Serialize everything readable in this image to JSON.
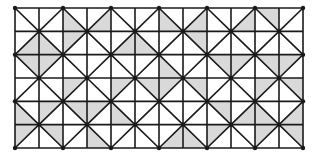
{
  "diagram": {
    "type": "tiling-grid",
    "grid": {
      "left": 15,
      "top": 8,
      "right": 303,
      "bottom": 148,
      "columns": 12,
      "rows": 6
    },
    "colors": {
      "line": "#1a1a1a",
      "shade": "#d9d9d9",
      "background": "#ffffff"
    },
    "line_width": 1.6,
    "node_radius": 2.2,
    "shaded_triangles": [
      {
        "row": 0,
        "col": 2,
        "tri": "ll"
      },
      {
        "row": 0,
        "col": 3,
        "tri": "lr"
      },
      {
        "row": 0,
        "col": 6,
        "tri": "ll"
      },
      {
        "row": 0,
        "col": 7,
        "tri": "lr"
      },
      {
        "row": 0,
        "col": 9,
        "tri": "lr"
      },
      {
        "row": 0,
        "col": 10,
        "tri": "ur"
      },
      {
        "row": 1,
        "col": 0,
        "tri": "lr"
      },
      {
        "row": 1,
        "col": 1,
        "tri": "ll"
      },
      {
        "row": 1,
        "col": 2,
        "tri": "ul"
      },
      {
        "row": 1,
        "col": 4,
        "tri": "lr"
      },
      {
        "row": 1,
        "col": 5,
        "tri": "ll"
      },
      {
        "row": 1,
        "col": 7,
        "tri": "ur"
      },
      {
        "row": 2,
        "col": 0,
        "tri": "ur"
      },
      {
        "row": 2,
        "col": 1,
        "tri": "ul"
      },
      {
        "row": 2,
        "col": 6,
        "tri": "ll"
      },
      {
        "row": 2,
        "col": 8,
        "tri": "ur"
      },
      {
        "row": 2,
        "col": 9,
        "tri": "ul"
      },
      {
        "row": 2,
        "col": 10,
        "tri": "ur"
      },
      {
        "row": 2,
        "col": 11,
        "tri": "ul"
      },
      {
        "row": 3,
        "col": 2,
        "tri": "ul"
      },
      {
        "row": 3,
        "col": 4,
        "tri": "ul"
      },
      {
        "row": 3,
        "col": 5,
        "tri": "ur"
      },
      {
        "row": 3,
        "col": 6,
        "tri": "ul"
      },
      {
        "row": 3,
        "col": 7,
        "tri": "ur"
      },
      {
        "row": 3,
        "col": 10,
        "tri": "ul"
      },
      {
        "row": 3,
        "col": 11,
        "tri": "ur"
      },
      {
        "row": 4,
        "col": 0,
        "tri": "ll"
      },
      {
        "row": 4,
        "col": 1,
        "tri": "ul"
      },
      {
        "row": 4,
        "col": 2,
        "tri": "ur"
      },
      {
        "row": 4,
        "col": 3,
        "tri": "ul"
      },
      {
        "row": 4,
        "col": 4,
        "tri": "ll"
      },
      {
        "row": 4,
        "col": 8,
        "tri": "ur"
      },
      {
        "row": 4,
        "col": 9,
        "tri": "lr"
      },
      {
        "row": 4,
        "col": 10,
        "tri": "ll"
      },
      {
        "row": 4,
        "col": 11,
        "tri": "lr"
      },
      {
        "row": 5,
        "col": 0,
        "tri": "ul"
      },
      {
        "row": 5,
        "col": 1,
        "tri": "ur"
      },
      {
        "row": 5,
        "col": 3,
        "tri": "lr"
      },
      {
        "row": 5,
        "col": 6,
        "tri": "lr"
      },
      {
        "row": 5,
        "col": 7,
        "tri": "ll"
      },
      {
        "row": 5,
        "col": 8,
        "tri": "ul"
      },
      {
        "row": 5,
        "col": 10,
        "tri": "ul"
      },
      {
        "row": 5,
        "col": 11,
        "tri": "ur"
      }
    ]
  }
}
